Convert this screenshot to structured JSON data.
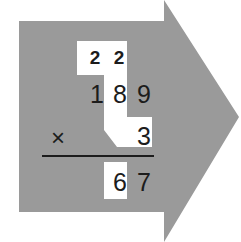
{
  "colors": {
    "arrow": "#9a9a9a",
    "highlight": "#ffffff",
    "text": "#1c1c1c",
    "background": "#ffffff"
  },
  "problem": {
    "carries": [
      "2",
      "2"
    ],
    "multiplicand": [
      "1",
      "8",
      "9"
    ],
    "operator": "×",
    "multiplier": "3",
    "partial_product": [
      "6",
      "7"
    ]
  }
}
